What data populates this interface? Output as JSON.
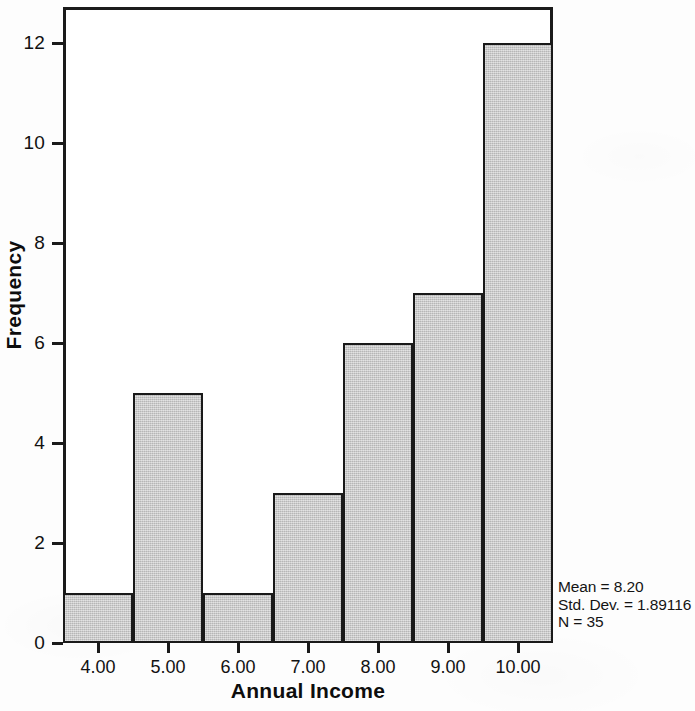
{
  "chart_data": {
    "type": "bar",
    "title": "",
    "subtitle": "",
    "xlabel": "Annual Income",
    "ylabel": "Frequency",
    "categories": [
      "4.00",
      "5.00",
      "6.00",
      "7.00",
      "8.00",
      "9.00",
      "10.00"
    ],
    "values": [
      1,
      5,
      1,
      3,
      6,
      7,
      12
    ],
    "x_tick_labels": [
      "4.00",
      "5.00",
      "6.00",
      "7.00",
      "8.00",
      "9.00",
      "10.00"
    ],
    "y_tick_labels": [
      "0",
      "2",
      "4",
      "6",
      "8",
      "10",
      "12"
    ],
    "y_tick_values": [
      0,
      2,
      4,
      6,
      8,
      10,
      12
    ],
    "ylim": [
      0,
      12.8
    ],
    "xlim": [
      3.5,
      10.5
    ],
    "grid": false,
    "legend": false,
    "bar_fill_color": "#c9c9c9",
    "bar_edge_color": "#1a1a1a",
    "annotations": [
      "Mean = 8.20",
      "Std. Dev. = 1.89116",
      "N = 35"
    ]
  },
  "statistics": {
    "mean_line": "Mean = 8.20",
    "std_dev_line": "Std. Dev. = 1.89116",
    "n_line": "N = 35"
  },
  "axes": {
    "x_title": "Annual Income",
    "y_title": "Frequency"
  }
}
